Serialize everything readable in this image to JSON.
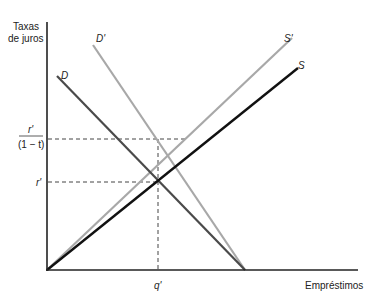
{
  "axes": {
    "y_label_line1": "Taxas",
    "y_label_line2": "de juros",
    "x_label": "Empréstimos"
  },
  "curves": {
    "D": {
      "label": "D",
      "color": "#4a4a4a"
    },
    "D_prime": {
      "label": "D'",
      "color": "#a8a8a8"
    },
    "S": {
      "label": "S",
      "color": "#111111"
    },
    "S_prime": {
      "label": "S'",
      "color": "#a8a8a8"
    }
  },
  "ticks": {
    "r_prime": "r'",
    "r_prime_over_numer": "r'",
    "r_prime_over_denom": "(1 − t)",
    "q_prime": "q'"
  }
}
